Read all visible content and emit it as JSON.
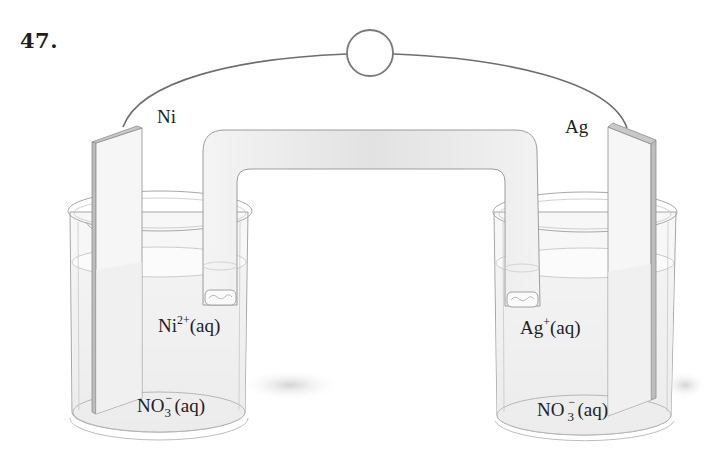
{
  "question": {
    "number": "47."
  },
  "diagram": {
    "type": "galvanic-cell",
    "meter": {
      "shape": "circle",
      "label": ""
    },
    "left_half_cell": {
      "electrode": {
        "label": "Ni"
      },
      "cation": {
        "base": "Ni",
        "charge": "2+",
        "state": "(aq)"
      },
      "anion": {
        "base": "NO",
        "subscript": "3",
        "charge": "−",
        "state": "(aq)"
      }
    },
    "right_half_cell": {
      "electrode": {
        "label": "Ag"
      },
      "cation": {
        "base": "Ag",
        "charge": "+",
        "state": "(aq)"
      },
      "anion": {
        "base": "NO",
        "subscript": "3",
        "charge": "−",
        "state": "(aq)"
      }
    },
    "salt_bridge": {
      "label": ""
    },
    "colors": {
      "outline": "#8a8a8a",
      "wire": "#6e6e6e",
      "glass": "#f1f1f1",
      "bridge_fill": "#e9e9e9",
      "electrode_face": "#f6f6f6",
      "electrode_edge": "#b9b9b9",
      "text": "#222222"
    }
  }
}
